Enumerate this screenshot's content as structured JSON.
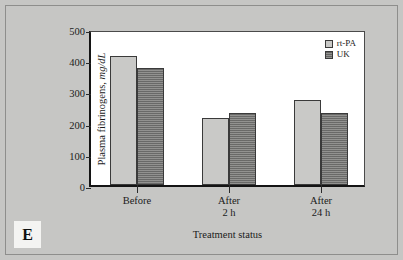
{
  "figure": {
    "panel_tag": "E",
    "background_color": "#c6c6c4",
    "plot_background_color": "#ffffff"
  },
  "chart_data": {
    "type": "bar",
    "title": "",
    "subtitle": "",
    "xlabel": "Treatment status",
    "ylabel": "Plasma fibrinogens,",
    "ylabel_units": "mg/dL",
    "categories": [
      "Before",
      "After\n2 h",
      "After\n24 h"
    ],
    "category_lines": [
      [
        "Before"
      ],
      [
        "After",
        "2 h"
      ],
      [
        "After",
        "24 h"
      ]
    ],
    "series": [
      {
        "name": "rt-PA",
        "values": [
          415,
          215,
          272
        ],
        "color": "#c9c9c7",
        "pattern": "solid"
      },
      {
        "name": "UK",
        "values": [
          375,
          232,
          232
        ],
        "color": "#8b8b89",
        "pattern": "horizontal-hatch"
      }
    ],
    "ylim": [
      0,
      500
    ],
    "yticks": [
      0,
      100,
      200,
      300,
      400,
      500
    ],
    "ytick_labels": [
      "0",
      "100",
      "200",
      "300",
      "400",
      "500"
    ],
    "grid": false,
    "legend_position": "top-right-inside"
  }
}
